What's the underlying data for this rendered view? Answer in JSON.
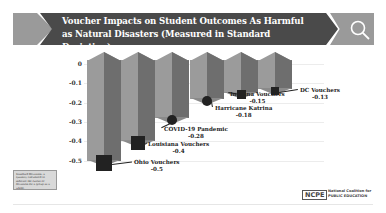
{
  "header": {
    "title": "Voucher Impacts on Student Outcomes As Harmful as Natural Disasters (Measured in Standard Deviation)",
    "icon": "search-icon"
  },
  "chart_data": {
    "type": "bar",
    "title": "Voucher Impacts on Student Outcomes As Harmful as Natural Disasters (Measured in Standard Deviation)",
    "categories": [
      "Ohio Vouchers",
      "Louisiana Vouchers",
      "COVID-19 Pandemic",
      "Harricane Katrina",
      "Indiana Vouchers",
      "DC Vouchers"
    ],
    "values": [
      -0.5,
      -0.4,
      -0.28,
      -0.18,
      -0.15,
      -0.13
    ],
    "value_labels": [
      "-0.5",
      "-0.4",
      "-0.28",
      "-0.18",
      "-0.15",
      "-0.13"
    ],
    "xlabel": "",
    "ylabel": "Standard Deviation",
    "ylim": [
      -0.5,
      0
    ],
    "yticks": [
      "0",
      "-0.1",
      "-0.2",
      "-0.3",
      "-0.4",
      "-0.5"
    ],
    "grid": true,
    "legend": "none",
    "icons": [
      "ohio-state-icon",
      "louisiana-state-icon",
      "virus-icon",
      "hurricane-icon",
      "indiana-state-icon",
      "dc-shape-icon"
    ]
  },
  "footnote": {
    "term": "Standard Deviation",
    "text": "Standard Deviation: a quantity calculated to indicate the extent of deviation for a group as a whole."
  },
  "logo": {
    "acronym": "NCPE",
    "line1": "National Coalition for",
    "line2": "PUBLIC EDUCATION"
  }
}
